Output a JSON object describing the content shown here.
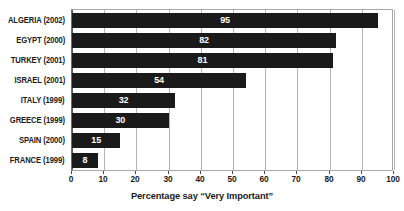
{
  "chart_data": {
    "type": "bar",
    "orientation": "horizontal",
    "title": "",
    "subtitle": "",
    "xlabel": "Percentage say “Very Important”",
    "ylabel": "",
    "xlim": [
      0,
      100
    ],
    "xticks": [
      0,
      10,
      20,
      30,
      40,
      50,
      60,
      70,
      80,
      90,
      100
    ],
    "xtick_labels": [
      "0",
      "10",
      "20",
      "30",
      "40",
      "50",
      "60",
      "70",
      "80",
      "90",
      "100"
    ],
    "grid": true,
    "grid_axis": "x",
    "legend": false,
    "legend_position": "none",
    "bar_color": "#1a1a1a",
    "value_label_color": "#ffffff",
    "gridline_color": "#b4b4b4",
    "plot_border_color": "#a8a8a8",
    "categories": [
      "ALGERIA (2002)",
      "EGYPT (2000)",
      "TURKEY (2001)",
      "ISRAEL (2001)",
      "ITALY (1999)",
      "GREECE (1999)",
      "SPAIN (2000)",
      "FRANCE (1999)"
    ],
    "values": [
      95,
      82,
      81,
      54,
      32,
      30,
      15,
      8
    ],
    "value_labels": [
      "95",
      "82",
      "81",
      "54",
      "32",
      "30",
      "15",
      "8"
    ]
  }
}
